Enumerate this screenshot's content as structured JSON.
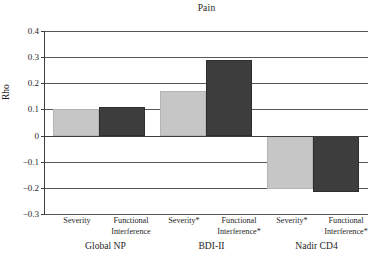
{
  "chart_data": {
    "type": "bar",
    "title": "Pain",
    "xlabel": "",
    "ylabel": "Rho",
    "ylim": [
      -0.3,
      0.4
    ],
    "ytick_labels": [
      "0.4",
      "0.3",
      "0.2",
      "0.1",
      "0",
      "−0.1",
      "−0.2",
      "−0.3"
    ],
    "ytick_values": [
      0.4,
      0.3,
      0.2,
      0.1,
      0,
      -0.1,
      -0.2,
      -0.3
    ],
    "grid": true,
    "legend": "none",
    "groups": [
      {
        "name": "Global NP",
        "categories": [
          "Severity",
          "Functional Interference"
        ],
        "values": [
          0.1,
          0.108
        ]
      },
      {
        "name": "BDI-II",
        "categories": [
          "Severity*",
          "Functional Interference*"
        ],
        "values": [
          0.17,
          0.29
        ]
      },
      {
        "name": "Nadir CD4",
        "categories": [
          "Severity*",
          "Functional Interference*"
        ],
        "values": [
          -0.205,
          -0.215
        ]
      }
    ],
    "categories": [
      "Severity",
      "Functional Interference",
      "Severity*",
      "Functional Interference*",
      "Severity*",
      "Functional Interference*"
    ],
    "values": [
      0.1,
      0.108,
      0.17,
      0.29,
      -0.205,
      -0.215
    ],
    "bar_styles": [
      "light",
      "dark",
      "light",
      "dark",
      "light",
      "dark"
    ],
    "colors": {
      "light_bar": "#c6c6c6",
      "dark_bar": "#3d3d3d",
      "axis": "#3b3e41",
      "gridline": "#55585b",
      "background": "#ffffff"
    }
  },
  "labels": {
    "x_tick_0_line1": "Severity",
    "x_tick_0_line2": "",
    "x_tick_1_line1": "Functional",
    "x_tick_1_line2": "Interference",
    "x_tick_2_line1": "Severity*",
    "x_tick_2_line2": "",
    "x_tick_3_line1": "Functional",
    "x_tick_3_line2": "Interference*",
    "x_tick_4_line1": "Severity*",
    "x_tick_4_line2": "",
    "x_tick_5_line1": "Functional",
    "x_tick_5_line2": "Interference*",
    "group_0": "Global NP",
    "group_1": "BDI-II",
    "group_2": "Nadir CD4"
  }
}
